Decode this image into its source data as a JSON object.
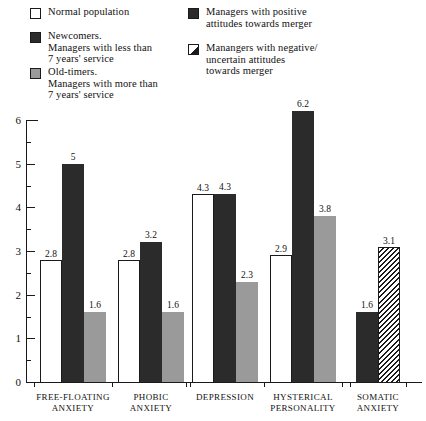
{
  "legend": {
    "columns": [
      {
        "name": "legend-column-left",
        "entries": [
          {
            "swatch": "white-square-icon",
            "style": "white",
            "label": "Normal population"
          },
          {
            "swatch": "dark-square-icon",
            "style": "dark",
            "label": "Newcomers.\nManagers with less than\n7 years' service"
          },
          {
            "swatch": "gray-square-icon",
            "style": "gray",
            "label": "Old-timers.\nManagers with more than\n7 years' service"
          }
        ]
      },
      {
        "name": "legend-column-right",
        "entries": [
          {
            "swatch": "dark-square-icon",
            "style": "dark",
            "label": "Managers with positive\nattitudes towards merger"
          },
          {
            "swatch": "hatched-square-icon",
            "style": "hatch",
            "label": "Manangers with negative/\nuncertain attitudes\ntowards merger"
          }
        ]
      }
    ]
  },
  "chart_data": {
    "type": "bar",
    "title": "",
    "subtitle": "",
    "xlabel": "",
    "ylabel": "",
    "ylim": [
      0,
      6
    ],
    "yticks": [
      0,
      1,
      2,
      3,
      4,
      5,
      6
    ],
    "yticks_minor": [
      0.5,
      1.5,
      2.5,
      3.5,
      4.5,
      5.5
    ],
    "grid": false,
    "legend_position": "top",
    "categories": [
      "FREE-FLOATING\nANXIETY",
      "PHOBIC\nANXIETY",
      "DEPRESSION",
      "HYSTERICAL\nPERSONALITY",
      "SOMATIC\nANXIETY"
    ],
    "series": [
      {
        "name": "Normal population",
        "style": "white",
        "values": [
          2.8,
          2.8,
          4.3,
          2.9,
          null
        ]
      },
      {
        "name": "Newcomers. Managers with less than 7 years' service",
        "style": "dark",
        "values": [
          5,
          3.2,
          4.3,
          6.2,
          null
        ]
      },
      {
        "name": "Old-timers. Managers with more than 7 years' service",
        "style": "gray",
        "values": [
          1.6,
          1.6,
          2.3,
          3.8,
          null
        ]
      },
      {
        "name": "Managers with positive attitudes towards merger",
        "style": "dark",
        "values": [
          null,
          null,
          null,
          null,
          1.6
        ]
      },
      {
        "name": "Manangers with negative/uncertain attitudes towards merger",
        "style": "hatch",
        "values": [
          null,
          null,
          null,
          null,
          3.1
        ]
      }
    ],
    "groups": [
      {
        "category": "FREE-FLOATING\nANXIETY",
        "bars": [
          {
            "style": "white",
            "value": 2.8,
            "label": "2.8"
          },
          {
            "style": "dark",
            "value": 5,
            "label": "5"
          },
          {
            "style": "gray",
            "value": 1.6,
            "label": "1.6"
          }
        ]
      },
      {
        "category": "PHOBIC\nANXIETY",
        "bars": [
          {
            "style": "white",
            "value": 2.8,
            "label": "2.8"
          },
          {
            "style": "dark",
            "value": 3.2,
            "label": "3.2"
          },
          {
            "style": "gray",
            "value": 1.6,
            "label": "1.6"
          }
        ]
      },
      {
        "category": "DEPRESSION",
        "bars": [
          {
            "style": "white",
            "value": 4.3,
            "label": "4.3"
          },
          {
            "style": "dark",
            "value": 4.3,
            "label": "4.3"
          },
          {
            "style": "gray",
            "value": 2.3,
            "label": "2.3"
          }
        ]
      },
      {
        "category": "HYSTERICAL\nPERSONALITY",
        "bars": [
          {
            "style": "white",
            "value": 2.9,
            "label": "2.9"
          },
          {
            "style": "dark",
            "value": 6.2,
            "label": "6.2"
          },
          {
            "style": "gray",
            "value": 3.8,
            "label": "3.8"
          }
        ]
      },
      {
        "category": "SOMATIC\nANXIETY",
        "bars": [
          {
            "style": "dark",
            "value": 1.6,
            "label": "1.6"
          },
          {
            "style": "hatch",
            "value": 3.1,
            "label": "3.1"
          }
        ]
      }
    ]
  },
  "colors": {
    "dark": "#2b2b2b",
    "gray": "#9a9a9a",
    "white": "#ffffff",
    "axis": "#1a1a1a",
    "background": "#ffffff"
  }
}
